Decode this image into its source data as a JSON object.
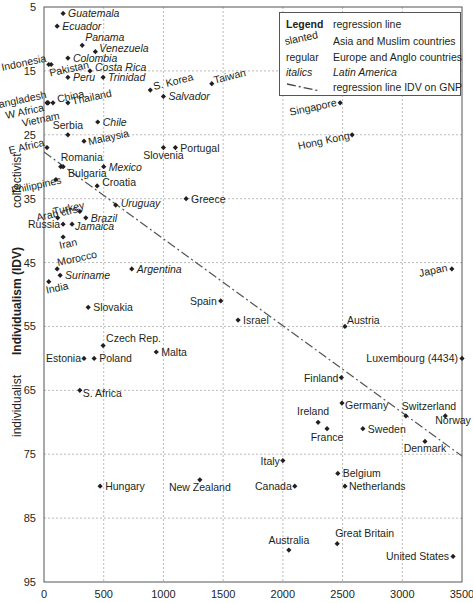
{
  "chart_data": {
    "type": "scatter",
    "title": "",
    "xlabel": "",
    "ylabel": "Individualism (IDV)",
    "ylabel_top": "collectivist",
    "ylabel_bottom": "individualist",
    "xlim": [
      0,
      3500
    ],
    "ylim": [
      95,
      5
    ],
    "y_inverted": true,
    "x_ticks": [
      "0",
      "500",
      "1000",
      "1500",
      "2000",
      "2500",
      "3000",
      "3500"
    ],
    "y_ticks": [
      "5",
      "15",
      "25",
      "35",
      "45",
      "55",
      "65",
      "75",
      "85",
      "95"
    ],
    "grid": true,
    "legend": {
      "title": "Legend",
      "entries": [
        {
          "key": "Legend",
          "text": "regression line"
        },
        {
          "key": "slanted",
          "text": "Asia and Muslim countries"
        },
        {
          "key": "regular",
          "text": "Europe and Anglo countries"
        },
        {
          "key": "italics",
          "text": "Latin America"
        },
        {
          "key": "dash-dot",
          "text": "regression line IDV on GNP"
        }
      ],
      "position": "top-right"
    },
    "regression_line": {
      "x": [
        0,
        3500
      ],
      "y": [
        27.7,
        75.3
      ],
      "style": "dash-dot"
    },
    "points": [
      {
        "name": "Guatemala",
        "x": 160,
        "y": 6,
        "style": "italic"
      },
      {
        "name": "Ecuador",
        "x": 110,
        "y": 8,
        "style": "italic"
      },
      {
        "name": "Panama",
        "x": 320,
        "y": 11,
        "style": "italic"
      },
      {
        "name": "Venezuela",
        "x": 430,
        "y": 12,
        "style": "italic"
      },
      {
        "name": "Colombia",
        "x": 200,
        "y": 13,
        "style": "italic"
      },
      {
        "name": "Indonesia",
        "x": 40,
        "y": 14,
        "style": "slanted"
      },
      {
        "name": "Pakistan",
        "x": 60,
        "y": 14,
        "style": "slanted"
      },
      {
        "name": "Costa Rica",
        "x": 385,
        "y": 15,
        "style": "italic"
      },
      {
        "name": "Peru",
        "x": 200,
        "y": 16,
        "style": "italic"
      },
      {
        "name": "Trinidad",
        "x": 495,
        "y": 16,
        "style": "italic"
      },
      {
        "name": "S. Korea",
        "x": 890,
        "y": 18,
        "style": "slanted"
      },
      {
        "name": "Taiwan",
        "x": 1405,
        "y": 17,
        "style": "slanted"
      },
      {
        "name": "Salvador",
        "x": 1000,
        "y": 19,
        "style": "italic"
      },
      {
        "name": "Bangladesh",
        "x": 25,
        "y": 20,
        "style": "slanted"
      },
      {
        "name": "W Africa",
        "x": 30,
        "y": 20,
        "style": "slanted"
      },
      {
        "name": "Vietnam",
        "x": 35,
        "y": 20,
        "style": "slanted"
      },
      {
        "name": "China",
        "x": 75,
        "y": 20,
        "style": "slanted"
      },
      {
        "name": "Thailand",
        "x": 200,
        "y": 20,
        "style": "slanted"
      },
      {
        "name": "Singapore",
        "x": 2480,
        "y": 20,
        "style": "slanted"
      },
      {
        "name": "Chile",
        "x": 450,
        "y": 23,
        "style": "italic"
      },
      {
        "name": "Serbia",
        "x": 200,
        "y": 25,
        "style": "regular"
      },
      {
        "name": "Hong Kong",
        "x": 2580,
        "y": 25,
        "style": "slanted"
      },
      {
        "name": "Malaysia",
        "x": 335,
        "y": 26,
        "style": "slanted"
      },
      {
        "name": "E Africa",
        "x": 25,
        "y": 27,
        "style": "slanted"
      },
      {
        "name": "Slovenia",
        "x": 1000,
        "y": 27,
        "style": "regular"
      },
      {
        "name": "Portugal",
        "x": 1100,
        "y": 27,
        "style": "regular"
      },
      {
        "name": "Romania",
        "x": 140,
        "y": 30,
        "style": "regular"
      },
      {
        "name": "Bulgaria",
        "x": 160,
        "y": 30,
        "style": "regular"
      },
      {
        "name": "Mexico",
        "x": 500,
        "y": 30,
        "style": "italic"
      },
      {
        "name": "Philippines",
        "x": 100,
        "y": 32,
        "style": "slanted"
      },
      {
        "name": "Croatia",
        "x": 445,
        "y": 33,
        "style": "regular"
      },
      {
        "name": "Greece",
        "x": 1190,
        "y": 35,
        "style": "regular"
      },
      {
        "name": "Uruguay",
        "x": 600,
        "y": 36,
        "style": "italic"
      },
      {
        "name": "Turkey",
        "x": 300,
        "y": 37,
        "style": "slanted"
      },
      {
        "name": "Arab ctrs",
        "x": 115,
        "y": 38,
        "style": "slanted"
      },
      {
        "name": "Brazil",
        "x": 350,
        "y": 38,
        "style": "italic"
      },
      {
        "name": "Russia",
        "x": 160,
        "y": 39,
        "style": "regular"
      },
      {
        "name": "Jamaica",
        "x": 235,
        "y": 39,
        "style": "italic"
      },
      {
        "name": "Iran",
        "x": 160,
        "y": 41,
        "style": "slanted"
      },
      {
        "name": "Morocco",
        "x": 110,
        "y": 46,
        "style": "slanted"
      },
      {
        "name": "Argentina",
        "x": 735,
        "y": 46,
        "style": "italic"
      },
      {
        "name": "Japan",
        "x": 3415,
        "y": 46,
        "style": "slanted"
      },
      {
        "name": "Suriname",
        "x": 135,
        "y": 47,
        "style": "italic"
      },
      {
        "name": "India",
        "x": 40,
        "y": 48,
        "style": "slanted"
      },
      {
        "name": "Spain",
        "x": 1480,
        "y": 51,
        "style": "regular"
      },
      {
        "name": "Slovakia",
        "x": 370,
        "y": 52,
        "style": "regular"
      },
      {
        "name": "Israel",
        "x": 1625,
        "y": 54,
        "style": "regular"
      },
      {
        "name": "Austria",
        "x": 2520,
        "y": 55,
        "style": "regular"
      },
      {
        "name": "Czech Rep.",
        "x": 495,
        "y": 58,
        "style": "regular"
      },
      {
        "name": "Malta",
        "x": 940,
        "y": 59,
        "style": "regular"
      },
      {
        "name": "Estonia",
        "x": 335,
        "y": 60,
        "style": "regular"
      },
      {
        "name": "Poland",
        "x": 420,
        "y": 60,
        "style": "regular"
      },
      {
        "name": "Luxembourg (4434)",
        "x": 3500,
        "y": 60,
        "style": "regular"
      },
      {
        "name": "Finland",
        "x": 2490,
        "y": 63,
        "style": "regular"
      },
      {
        "name": "S. Africa",
        "x": 300,
        "y": 65,
        "style": "regular"
      },
      {
        "name": "Germany",
        "x": 2495,
        "y": 67,
        "style": "regular"
      },
      {
        "name": "Switzerland",
        "x": 3030,
        "y": 69,
        "style": "regular"
      },
      {
        "name": "Norway",
        "x": 3360,
        "y": 69,
        "style": "regular"
      },
      {
        "name": "Ireland",
        "x": 2295,
        "y": 70,
        "style": "regular"
      },
      {
        "name": "France",
        "x": 2370,
        "y": 71,
        "style": "regular"
      },
      {
        "name": "Sweden",
        "x": 2670,
        "y": 71,
        "style": "regular"
      },
      {
        "name": "Denmark",
        "x": 3190,
        "y": 73,
        "style": "regular"
      },
      {
        "name": "Italy",
        "x": 2000,
        "y": 76,
        "style": "regular"
      },
      {
        "name": "Belgium",
        "x": 2460,
        "y": 78,
        "style": "regular"
      },
      {
        "name": "New Zealand",
        "x": 1305,
        "y": 79,
        "style": "regular"
      },
      {
        "name": "Hungary",
        "x": 470,
        "y": 80,
        "style": "regular"
      },
      {
        "name": "Canada",
        "x": 2100,
        "y": 80,
        "style": "regular"
      },
      {
        "name": "Netherlands",
        "x": 2520,
        "y": 80,
        "style": "regular"
      },
      {
        "name": "Great Britain",
        "x": 2455,
        "y": 89,
        "style": "regular"
      },
      {
        "name": "Australia",
        "x": 2050,
        "y": 90,
        "style": "regular"
      },
      {
        "name": "United States",
        "x": 3425,
        "y": 91,
        "style": "regular"
      }
    ]
  },
  "labels": {
    "ylabel": "Individualism (IDV)",
    "ylabel_top": "collectivist",
    "ylabel_bottom": "individualist"
  },
  "legend": {
    "title": "Legend",
    "title_text": "regression line",
    "slanted_key": "slanted",
    "slanted_text": "Asia and Muslim countries",
    "regular_key": "regular",
    "regular_text": "Europe and Anglo countries",
    "italics_key": "italics",
    "italics_text": "Latin America",
    "line_text": "regression line IDV on GNP"
  }
}
